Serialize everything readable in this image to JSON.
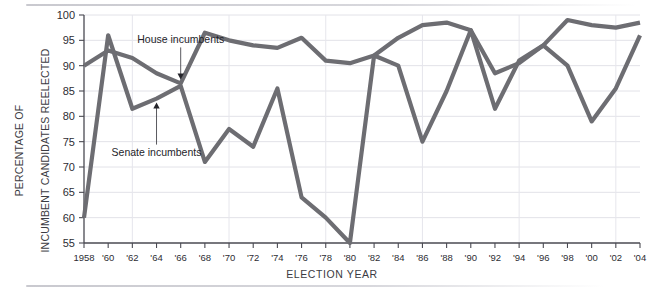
{
  "chart_data": {
    "type": "line",
    "title": "",
    "xlabel": "ELECTION YEAR",
    "ylabel": "PERCENTAGE OF INCUMBENT CANDIDATES REELECTED",
    "ylabel_line1": "PERCENTAGE OF",
    "ylabel_line2": "INCUMBENT CANDIDATES REELECTED",
    "ylim": [
      55,
      100
    ],
    "yticks": [
      55,
      60,
      65,
      70,
      75,
      80,
      85,
      90,
      95,
      100
    ],
    "ytick_labels": [
      "55",
      "60",
      "65",
      "70",
      "75",
      "80",
      "85",
      "90",
      "95",
      "100"
    ],
    "x": [
      1958,
      1960,
      1962,
      1964,
      1966,
      1968,
      1970,
      1972,
      1974,
      1976,
      1978,
      1980,
      1982,
      1984,
      1986,
      1988,
      1990,
      1992,
      1994,
      1996,
      1998,
      2000,
      2002,
      2004
    ],
    "xtick_labels": [
      "1958",
      "'60",
      "'62",
      "'64",
      "'66",
      "'68",
      "'70",
      "'72",
      "'74",
      "'76",
      "'78",
      "'80",
      "'82",
      "'84",
      "'86",
      "'88",
      "'90",
      "'92",
      "'94",
      "'96",
      "'98",
      "'00",
      "'02",
      "'04"
    ],
    "grid": true,
    "legend_position": "inline-annotations",
    "series": [
      {
        "name": "House incumbents",
        "color": "#6d6d72",
        "values": [
          90,
          93,
          91.5,
          88.5,
          86.5,
          96.5,
          95,
          94,
          93.5,
          95.5,
          91,
          90.5,
          92,
          95.5,
          98,
          98.5,
          97,
          88.5,
          90.5,
          94,
          99,
          98,
          97.5,
          98.5
        ]
      },
      {
        "name": "Senate incumbents",
        "color": "#6d6d72",
        "values": [
          60,
          96,
          81.5,
          83.5,
          86,
          71,
          77.5,
          74,
          85.5,
          64,
          60,
          55,
          92,
          90,
          75,
          85,
          97,
          81.5,
          91,
          94,
          90,
          79,
          85.5,
          96
        ]
      }
    ],
    "annotations": [
      {
        "text": "House incumbents",
        "series": "House incumbents",
        "points_to_year": 1966,
        "arrow": "down"
      },
      {
        "text": "Senate incumbents",
        "series": "Senate incumbents",
        "points_to_year": 1964,
        "arrow": "up"
      }
    ]
  },
  "axis": {
    "y_title_line1": "PERCENTAGE OF",
    "y_title_line2": "INCUMBENT CANDIDATES REELECTED",
    "x_title": "ELECTION YEAR"
  },
  "annotations": {
    "house_label": "House incumbents",
    "senate_label": "Senate incumbents"
  },
  "colors": {
    "line": "#6d6d72",
    "axis": "#4a4a52",
    "grid": "#e2e2e8",
    "text": "#2d2d33",
    "background": "#ffffff"
  }
}
